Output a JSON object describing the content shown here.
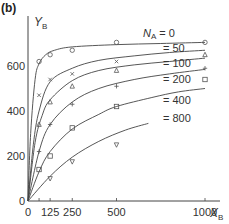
{
  "panel_label": "(b)",
  "chart_data": {
    "type": "scatter",
    "title": "",
    "xlabel": "X_B",
    "ylabel": "Y_B",
    "xlim": [
      0,
      1050
    ],
    "ylim": [
      0,
      780
    ],
    "x_ticks": [
      0,
      62.5,
      125,
      250,
      500,
      1000
    ],
    "x_tick_labels": [
      "0",
      "",
      "125",
      "250",
      "500",
      "1000"
    ],
    "y_ticks": [
      0,
      200,
      400,
      600
    ],
    "y_tick_labels": [
      "0",
      "200",
      "400",
      "600"
    ],
    "grid": false,
    "legend": "inline labels at right of curves",
    "series": [
      {
        "name": "N_A = 0",
        "label": "N_A = 0",
        "marker": "circle",
        "points": [
          [
            62.5,
            620
          ],
          [
            125,
            650
          ],
          [
            250,
            670
          ],
          [
            500,
            705
          ],
          [
            1000,
            705
          ]
        ],
        "curve": [
          [
            0,
            0
          ],
          [
            15,
            300
          ],
          [
            40,
            540
          ],
          [
            62.5,
            610
          ],
          [
            100,
            650
          ],
          [
            150,
            670
          ],
          [
            250,
            685
          ],
          [
            500,
            695
          ],
          [
            750,
            700
          ],
          [
            1000,
            705
          ]
        ]
      },
      {
        "name": "N_A = 50",
        "label": "= 50",
        "marker": "x",
        "points": [
          [
            62.5,
            470
          ],
          [
            125,
            540
          ],
          [
            250,
            565
          ],
          [
            500,
            620
          ]
        ],
        "curve": [
          [
            0,
            0
          ],
          [
            30,
            250
          ],
          [
            62.5,
            400
          ],
          [
            125,
            530
          ],
          [
            250,
            590
          ],
          [
            400,
            625
          ],
          [
            600,
            645
          ],
          [
            800,
            660
          ],
          [
            1000,
            670
          ]
        ]
      },
      {
        "name": "N_A = 100",
        "label": "= 100",
        "marker": "triangle-up",
        "points": [
          [
            62.5,
            340
          ],
          [
            125,
            440
          ],
          [
            250,
            510
          ],
          [
            500,
            580
          ],
          [
            1000,
            650
          ]
        ],
        "curve": [
          [
            0,
            0
          ],
          [
            40,
            260
          ],
          [
            80,
            380
          ],
          [
            125,
            450
          ],
          [
            250,
            535
          ],
          [
            400,
            580
          ],
          [
            600,
            605
          ],
          [
            800,
            620
          ],
          [
            1000,
            635
          ]
        ]
      },
      {
        "name": "N_A = 200",
        "label": "= 200",
        "marker": "plus",
        "points": [
          [
            62.5,
            220
          ],
          [
            125,
            340
          ],
          [
            250,
            430
          ],
          [
            500,
            510
          ],
          [
            1000,
            590
          ]
        ],
        "curve": [
          [
            0,
            0
          ],
          [
            62.5,
            220
          ],
          [
            125,
            340
          ],
          [
            250,
            440
          ],
          [
            400,
            500
          ],
          [
            600,
            540
          ],
          [
            800,
            565
          ],
          [
            1000,
            585
          ]
        ]
      },
      {
        "name": "N_A = 400",
        "label": "= 400",
        "marker": "square",
        "points": [
          [
            62.5,
            140
          ],
          [
            125,
            200
          ],
          [
            250,
            325
          ],
          [
            500,
            420
          ],
          [
            1000,
            540
          ]
        ],
        "curve": [
          [
            0,
            0
          ],
          [
            62.5,
            130
          ],
          [
            125,
            220
          ],
          [
            250,
            320
          ],
          [
            400,
            385
          ],
          [
            500,
            420
          ],
          [
            700,
            460
          ],
          [
            850,
            485
          ],
          [
            1000,
            500
          ]
        ]
      },
      {
        "name": "N_A = 800",
        "label": "= 800",
        "marker": "triangle-down",
        "points": [
          [
            125,
            100
          ],
          [
            250,
            175
          ],
          [
            500,
            250
          ]
        ],
        "curve": [
          [
            0,
            0
          ],
          [
            125,
            110
          ],
          [
            250,
            195
          ],
          [
            400,
            265
          ],
          [
            550,
            315
          ],
          [
            680,
            345
          ]
        ]
      }
    ]
  }
}
